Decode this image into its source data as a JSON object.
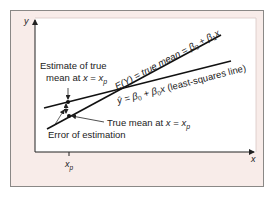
{
  "diagram": {
    "axes": {
      "y_label": "y",
      "x_label": "x",
      "x_tick_label": "x",
      "x_tick_sub": "p"
    },
    "lines": {
      "true_mean": {
        "label_lhs": "E(Y) = true mean = ",
        "beta0": "β",
        "beta0_sub": "0",
        "plus": " + ",
        "beta1": "β",
        "beta1_sub": "1",
        "var": "x"
      },
      "least_squares": {
        "label_lhs": "ŷ = ",
        "beta0": "β",
        "beta0_sub": "0",
        "plus": " + ",
        "beta1": "β",
        "beta1_sub": "0",
        "var": "x",
        "suffix": " (least-squares line)"
      }
    },
    "annotations": {
      "estimate_line1": "Estimate of true",
      "estimate_line2_prefix": "mean at ",
      "estimate_line2_var": "x",
      "estimate_line2_eq": " = ",
      "estimate_line2_xp": "x",
      "estimate_line2_sub": "p",
      "true_mean_prefix": "True mean at ",
      "true_mean_var": "x",
      "true_mean_eq": " = ",
      "true_mean_xp": "x",
      "true_mean_sub": "p",
      "error": "Error of estimation"
    },
    "colors": {
      "frame_bg": "#f8ece9",
      "plot_bg": "#ffffff",
      "ink": "#222222"
    }
  }
}
